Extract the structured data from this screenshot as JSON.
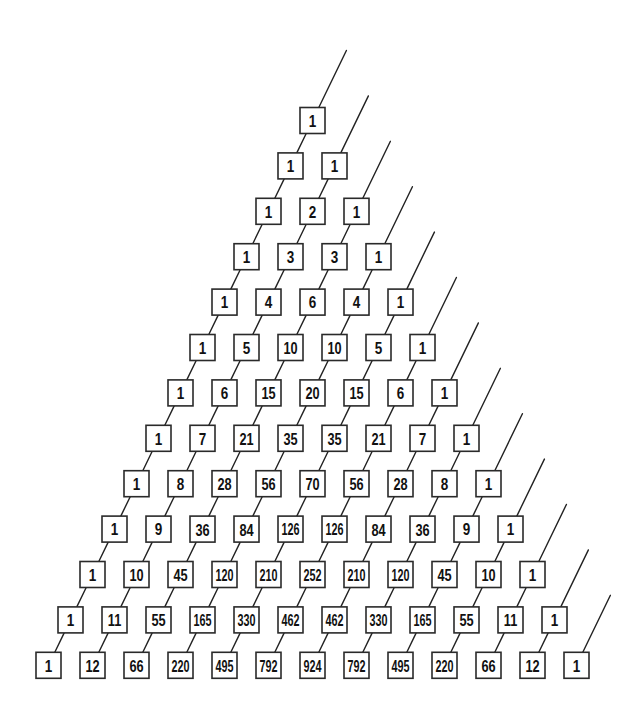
{
  "diagram": {
    "box_color": "#2a2a2a",
    "line_color": "#222222",
    "background": "#ffffff",
    "rows": [
      [
        1
      ],
      [
        1,
        1
      ],
      [
        1,
        2,
        1
      ],
      [
        1,
        3,
        3,
        1
      ],
      [
        1,
        4,
        6,
        4,
        1
      ],
      [
        1,
        5,
        10,
        10,
        5,
        1
      ],
      [
        1,
        6,
        15,
        20,
        15,
        6,
        1
      ],
      [
        1,
        7,
        21,
        35,
        35,
        21,
        7,
        1
      ],
      [
        1,
        8,
        28,
        56,
        70,
        56,
        28,
        8,
        1
      ],
      [
        1,
        9,
        36,
        84,
        126,
        126,
        84,
        36,
        9,
        1
      ],
      [
        1,
        10,
        45,
        120,
        210,
        252,
        210,
        120,
        45,
        10,
        1
      ],
      [
        1,
        11,
        55,
        165,
        330,
        462,
        462,
        330,
        165,
        55,
        11,
        1
      ],
      [
        1,
        12,
        66,
        220,
        495,
        792,
        924,
        792,
        495,
        220,
        66,
        12,
        1
      ]
    ],
    "layout": {
      "apex_x": 312.5,
      "apex_y": 120.5,
      "row_dx": 22,
      "row_dy": 45.4,
      "col_pitch": 44,
      "box_w": 25,
      "box_h": 26,
      "extension": 57
    }
  }
}
